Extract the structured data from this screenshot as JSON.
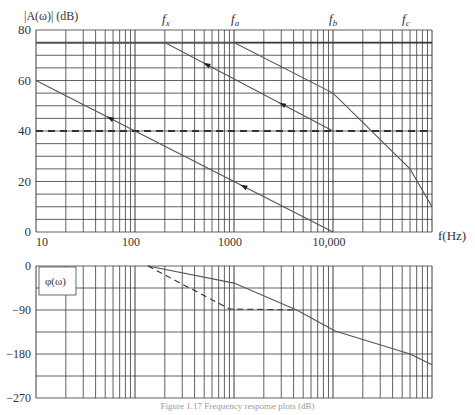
{
  "chart_data": [
    {
      "type": "line",
      "title": "",
      "ylabel": "|A(ω)| (dB)",
      "xlabel": "f(Hz)",
      "xscale": "log",
      "xlim": [
        10,
        100000
      ],
      "ylim": [
        0,
        80
      ],
      "x_tick_labels": [
        "10",
        "100",
        "1000",
        "10,000"
      ],
      "x_tick_values": [
        10,
        100,
        1000,
        10000
      ],
      "y_tick_labels": [
        "0",
        "20",
        "40",
        "60",
        "80"
      ],
      "y_tick_values": [
        0,
        20,
        40,
        60,
        80
      ],
      "grid": true,
      "y_grid_step": 5,
      "annotations": [
        {
          "text": "f_x",
          "x": 200
        },
        {
          "text": "f_a",
          "x": 1000
        },
        {
          "text": "f_b",
          "x": 10000
        },
        {
          "text": "f_c",
          "x": 60000
        }
      ],
      "series": [
        {
          "name": "open-loop gain",
          "style": "solid",
          "x": [
            10,
            1000,
            10000,
            60000,
            100000
          ],
          "y": [
            75,
            75,
            55,
            25,
            10
          ]
        },
        {
          "name": "compensated gain (f_x)",
          "style": "solid-arrows",
          "x": [
            10,
            200,
            10000
          ],
          "y": [
            75,
            75,
            40
          ]
        },
        {
          "name": "unity-slope gain line",
          "style": "solid-arrows",
          "x": [
            10,
            10000
          ],
          "y": [
            60,
            0
          ]
        },
        {
          "name": "closed-loop gain 40 dB",
          "style": "dashed",
          "x": [
            10,
            100000
          ],
          "y": [
            40,
            40
          ]
        }
      ]
    },
    {
      "type": "line",
      "title": "",
      "legend_box": "φ(ω)",
      "xscale": "log",
      "xlim": [
        10,
        100000
      ],
      "ylim": [
        -270,
        0
      ],
      "y_tick_labels": [
        "0",
        "−90",
        "−180",
        "−270"
      ],
      "y_tick_values": [
        0,
        -90,
        -180,
        -270
      ],
      "grid": true,
      "y_grid_step": 45,
      "series": [
        {
          "name": "phase (uncompensated)",
          "style": "solid",
          "x": [
            135,
            1000,
            4300,
            10500,
            60000,
            100000
          ],
          "y": [
            0,
            -35,
            -90,
            -133,
            -180,
            -202
          ]
        },
        {
          "name": "phase (compensated)",
          "style": "dashed",
          "x": [
            135,
            900,
            4300
          ],
          "y": [
            0,
            -88,
            -90
          ]
        }
      ]
    }
  ],
  "labels": {
    "top_ylabel": "|A(ω)| (dB)",
    "xlabel": "f(Hz)",
    "phase_box": "φ(ω)",
    "f_x": "f",
    "f_x_sub": "x",
    "f_a": "f",
    "f_a_sub": "a",
    "f_b": "f",
    "f_b_sub": "b",
    "f_c": "f",
    "f_c_sub": "c",
    "caption": "Figure 1.17  Frequency response plots (dB)"
  },
  "colors": {
    "grid": "#3a3a3a",
    "curve": "#555555",
    "dashed": "#333333",
    "text": "#333333"
  }
}
